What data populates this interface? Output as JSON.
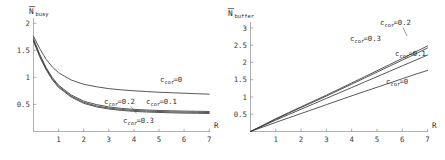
{
  "figure": {
    "background_color": "#ffffff",
    "curve_color": "#3a3a3a",
    "axis_color": "#8c8c8c",
    "panels": [
      "busy",
      "buffer"
    ]
  },
  "chart_data": [
    {
      "type": "line",
      "id": "n-busy",
      "title": "",
      "ylabel_main": "N",
      "ylabel_overbar": true,
      "ylabel_sub": "busy",
      "xlabel": "R",
      "xlim": [
        0,
        7.3
      ],
      "ylim": [
        0,
        2.12
      ],
      "xticks": [
        1,
        2,
        3,
        4,
        5,
        6,
        7
      ],
      "xtick_labels": [
        "1",
        "2",
        "3",
        "4",
        "5",
        "6",
        "7"
      ],
      "yticks": [
        0.5,
        1,
        1.5,
        2
      ],
      "ytick_labels": [
        "0.5",
        "1",
        "1.5",
        "2"
      ],
      "grid": false,
      "legend_position": "inline-annotations",
      "x": [
        0,
        0.25,
        0.5,
        0.75,
        1,
        1.5,
        2,
        2.5,
        3,
        3.5,
        4,
        4.5,
        5,
        5.5,
        6,
        6.5,
        7
      ],
      "series": [
        {
          "name": "c_cor=0",
          "label_main": "c",
          "label_sub": "cor",
          "label_value": "=0",
          "values": [
            1.98,
            1.72,
            1.5,
            1.34,
            1.22,
            1.07,
            0.98,
            0.93,
            0.89,
            0.865,
            0.845,
            0.83,
            0.815,
            0.805,
            0.795,
            0.785,
            0.775
          ]
        },
        {
          "name": "c_cor=0.1",
          "label_main": "c",
          "label_sub": "cor",
          "label_value": "=0.1",
          "values": [
            1.93,
            1.6,
            1.33,
            1.12,
            0.96,
            0.76,
            0.63,
            0.56,
            0.51,
            0.48,
            0.46,
            0.447,
            0.437,
            0.43,
            0.424,
            0.42,
            0.416
          ]
        },
        {
          "name": "c_cor=0.2",
          "label_main": "c",
          "label_sub": "cor",
          "label_value": "=0.2",
          "values": [
            1.9,
            1.575,
            1.305,
            1.095,
            0.935,
            0.735,
            0.605,
            0.532,
            0.487,
            0.458,
            0.438,
            0.425,
            0.415,
            0.408,
            0.402,
            0.398,
            0.394
          ]
        },
        {
          "name": "c_cor=0.3",
          "label_main": "c",
          "label_sub": "cor",
          "label_value": "=0.3",
          "values": [
            1.87,
            1.55,
            1.285,
            1.075,
            0.915,
            0.715,
            0.585,
            0.512,
            0.467,
            0.438,
            0.418,
            0.405,
            0.395,
            0.388,
            0.382,
            0.378,
            0.374
          ]
        }
      ]
    },
    {
      "type": "line",
      "id": "n-buffer",
      "title": "",
      "ylabel_main": "N",
      "ylabel_overbar": true,
      "ylabel_sub": "buffer",
      "xlabel": "R",
      "xlim": [
        0,
        7.3
      ],
      "ylim": [
        0,
        3.3
      ],
      "xticks": [
        1,
        2,
        3,
        4,
        5,
        6,
        7
      ],
      "xtick_labels": [
        "1",
        "2",
        "3",
        "4",
        "5",
        "6",
        "7"
      ],
      "yticks": [
        0.5,
        1,
        1.5,
        2,
        2.5,
        3
      ],
      "ytick_labels": [
        "0.5",
        "1",
        "1.5",
        "2",
        "2.5",
        "3"
      ],
      "grid": false,
      "legend_position": "inline-annotations",
      "x": [
        0,
        0.5,
        1,
        1.5,
        2,
        2.5,
        3,
        3.5,
        4,
        4.5,
        5,
        5.5,
        6,
        6.5,
        7
      ],
      "series": [
        {
          "name": "c_cor=0",
          "label_main": "c",
          "label_sub": "cor",
          "label_value": "=0",
          "values": [
            0,
            0.16,
            0.32,
            0.475,
            0.63,
            0.785,
            0.94,
            1.095,
            1.25,
            1.4,
            1.55,
            1.7,
            1.85,
            2.0,
            2.14
          ]
        },
        {
          "name": "c_cor=0.1",
          "label_main": "c",
          "label_sub": "cor",
          "label_value": "=0.1",
          "values": [
            0,
            0.2,
            0.4,
            0.59,
            0.78,
            0.97,
            1.16,
            1.35,
            1.54,
            1.73,
            1.92,
            2.11,
            2.3,
            2.49,
            2.68
          ]
        },
        {
          "name": "c_cor=0.2",
          "label_main": "c",
          "label_sub": "cor",
          "label_value": "=0.2",
          "values": [
            0,
            0.215,
            0.43,
            0.635,
            0.84,
            1.04,
            1.24,
            1.45,
            1.66,
            1.87,
            2.08,
            2.29,
            2.5,
            2.71,
            2.93
          ]
        },
        {
          "name": "c_cor=0.3",
          "label_main": "c",
          "label_sub": "cor",
          "label_value": "=0.3",
          "values": [
            0,
            0.225,
            0.45,
            0.66,
            0.865,
            1.07,
            1.275,
            1.485,
            1.7,
            1.915,
            2.13,
            2.345,
            2.56,
            2.78,
            3.0
          ]
        }
      ]
    }
  ],
  "left_panel": {
    "ylabel_main": "N",
    "ylabel_sub": "busy",
    "xlabel": "R",
    "ytick_labels": [
      "2",
      "1.5",
      "1",
      "0.5"
    ],
    "xtick_labels": [
      "1",
      "2",
      "3",
      "4",
      "5",
      "6",
      "7"
    ],
    "annotations": [
      {
        "main": "c",
        "sub": "cor",
        "value": "=0"
      },
      {
        "main": "c",
        "sub": "cor",
        "value": "=0.2"
      },
      {
        "main": "c",
        "sub": "cor",
        "value": "=0.1"
      },
      {
        "main": "c",
        "sub": "cor",
        "value": "=0.3"
      }
    ]
  },
  "right_panel": {
    "ylabel_main": "N",
    "ylabel_sub": "buffer",
    "xlabel": "R",
    "ytick_labels": [
      "3",
      "2.5",
      "2",
      "1.5",
      "1",
      "0.5"
    ],
    "xtick_labels": [
      "1",
      "2",
      "3",
      "4",
      "5",
      "6",
      "7"
    ],
    "annotations": [
      {
        "main": "c",
        "sub": "cor",
        "value": "=0.2"
      },
      {
        "main": "c",
        "sub": "cor",
        "value": "=0.3"
      },
      {
        "main": "c",
        "sub": "cor",
        "value": "=0.1"
      },
      {
        "main": "c",
        "sub": "cor",
        "value": "=0"
      }
    ]
  }
}
